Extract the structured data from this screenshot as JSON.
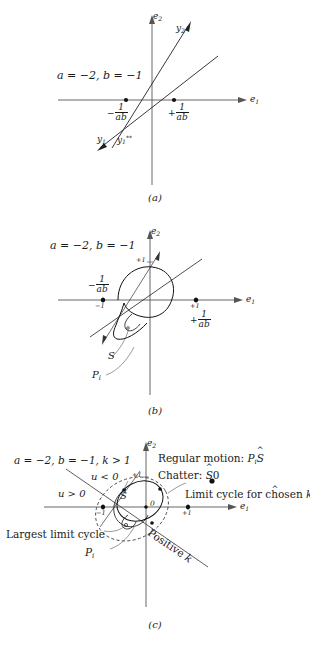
{
  "figure": {
    "type": "phase-plane-diagrams",
    "axis_x_label": "e",
    "axis_x_sub": "1",
    "axis_y_label": "e",
    "axis_y_sub": "2"
  },
  "panel_a": {
    "caption": "(a)",
    "params": "a = −2, b = −1",
    "line_y2_label": "y",
    "line_y2_sub": "2",
    "line_y1_label": "y",
    "line_y1_sub": "1",
    "line_y1ss_label": "y",
    "line_y1ss_sub": "1",
    "line_y1ss_sup": "**",
    "tick_neg_sign": "−",
    "tick_pos_sign": "+",
    "frac_num": "1",
    "frac_den": "ab"
  },
  "panel_b": {
    "caption": "(b)",
    "params": "a = −2, b = −1",
    "tick_y_plus1": "+1",
    "tick_x_minus1": "−1",
    "tick_x_plus1": "+1",
    "tick_neg_sign": "−",
    "tick_pos_sign": "+",
    "frac_num": "1",
    "frac_den": "ab",
    "label_S": "S",
    "label_Pi": "P",
    "label_Pi_sub": "i"
  },
  "panel_c": {
    "caption": "(c)",
    "params": "a = −2, b = −1, k > 1",
    "legend_regular_text": "Regular motion:",
    "legend_regular_sym_p": "P",
    "legend_regular_sym_sub": "i",
    "legend_regular_sym_s": "S",
    "legend_chatter_text": "Chatter:",
    "legend_chatter_sym_s": "S",
    "legend_chatter_sym_zero": "0",
    "label_u_neg": "u < 0",
    "label_u_pos": "u > 0",
    "label_S_hat": "S",
    "label_origin_zero": "0",
    "label_limit_cycle_chosen": "Limit cycle for chosen",
    "label_limit_cycle_chosen_k": "k",
    "label_largest_limit_cycle": "Largest limit cycle",
    "label_Pi": "P",
    "label_Pi_sub": "i",
    "label_positive_k_text": "Positive",
    "label_positive_k_k": "k",
    "tick_y_plus1": "+1",
    "tick_x_minus1": "−1",
    "tick_x_plus1": "+1"
  },
  "colors": {
    "ink": "#1a1a1a",
    "axis": "#4a4a4a",
    "curve": "#222222",
    "background": "#ffffff"
  }
}
